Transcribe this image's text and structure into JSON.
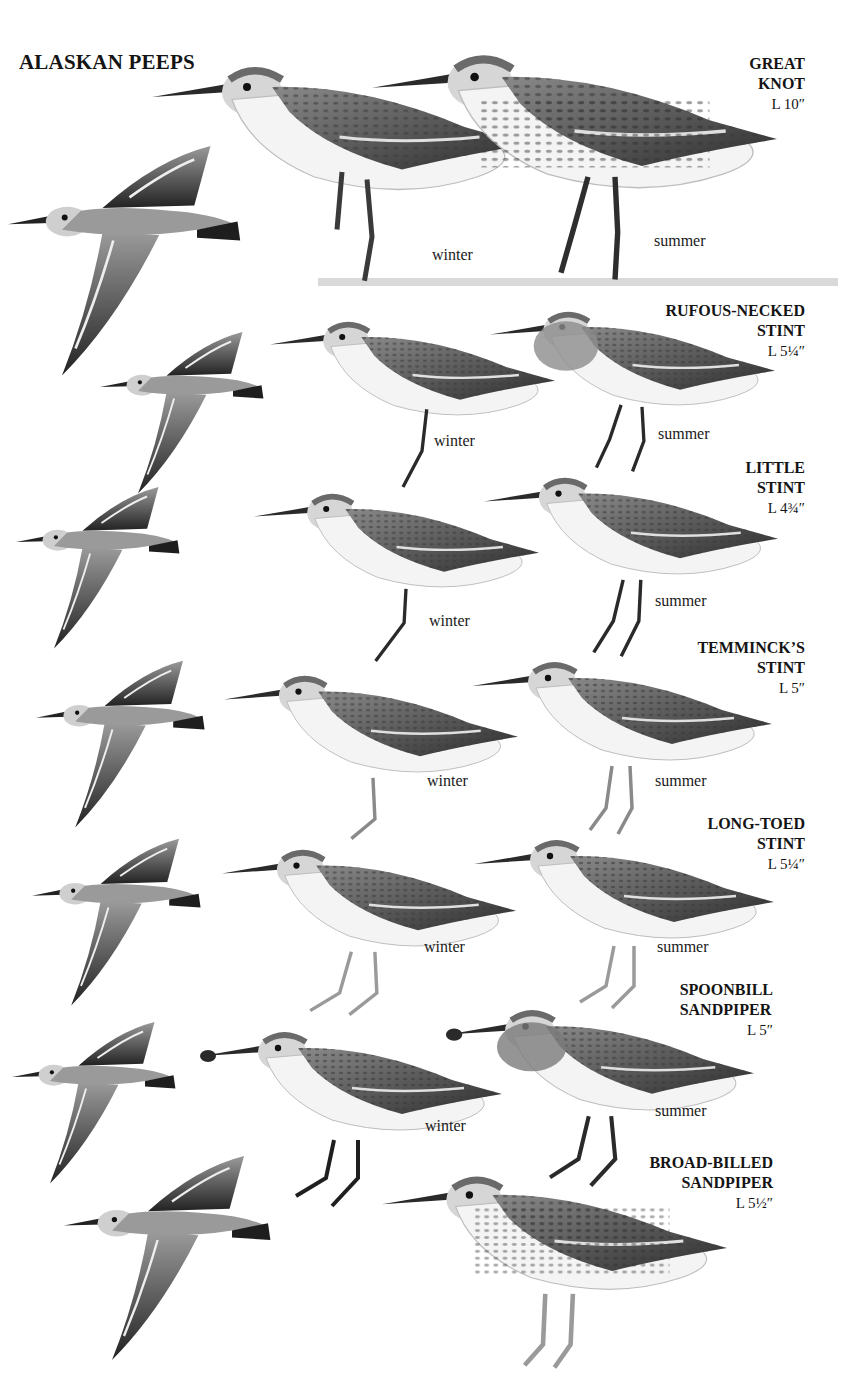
{
  "page": {
    "title": "ALASKAN PEEPS",
    "background": "#ffffff",
    "ink": "#141414"
  },
  "species": [
    {
      "name_line1": "GREAT",
      "name_line2": "KNOT",
      "length": "L 10″",
      "captions": [
        "winter",
        "summer"
      ]
    },
    {
      "name_line1": "RUFOUS-NECKED",
      "name_line2": "STINT",
      "length": "L 5¼″",
      "captions": [
        "winter",
        "summer"
      ]
    },
    {
      "name_line1": "LITTLE",
      "name_line2": "STINT",
      "length": "L 4¾″",
      "captions": [
        "winter",
        "summer"
      ]
    },
    {
      "name_line1": "TEMMINCK’S",
      "name_line2": "STINT",
      "length": "L 5″",
      "captions": [
        "winter",
        "summer"
      ]
    },
    {
      "name_line1": "LONG-TOED",
      "name_line2": "STINT",
      "length": "L 5¼″",
      "captions": [
        "winter",
        "summer"
      ]
    },
    {
      "name_line1": "SPOONBILL",
      "name_line2": "SANDPIPER",
      "length": "L 5″",
      "captions": [
        "winter",
        "summer"
      ]
    },
    {
      "name_line1": "BROAD-BILLED",
      "name_line2": "SANDPIPER",
      "length": "L 5½″",
      "captions": []
    }
  ]
}
